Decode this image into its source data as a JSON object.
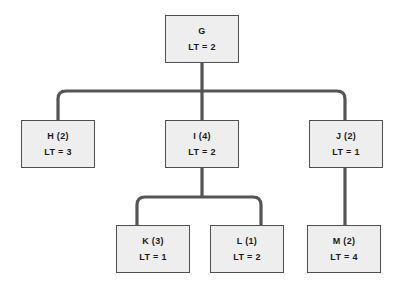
{
  "diagram": {
    "type": "tree",
    "background_color": "#ffffff",
    "node_fill_color": "#eeeeee",
    "node_border_color": "#4f4f4f",
    "connector_color": "#555555",
    "metric_prefix": "LT"
  },
  "nodes": [
    {
      "id": "G",
      "label": "G",
      "metric": "LT = 2",
      "lt": 2,
      "duration": null,
      "level": 0,
      "parent": null,
      "x": 165,
      "y": 15,
      "w": 74,
      "h": 48
    },
    {
      "id": "H",
      "label": "H (2)",
      "metric": "LT = 3",
      "lt": 3,
      "duration": 2,
      "level": 1,
      "parent": "G",
      "x": 21,
      "y": 120,
      "w": 74,
      "h": 48
    },
    {
      "id": "I",
      "label": "I (4)",
      "metric": "LT = 2",
      "lt": 2,
      "duration": 4,
      "level": 1,
      "parent": "G",
      "x": 165,
      "y": 120,
      "w": 74,
      "h": 48
    },
    {
      "id": "J",
      "label": "J (2)",
      "metric": "LT = 1",
      "lt": 1,
      "duration": 2,
      "level": 1,
      "parent": "G",
      "x": 309,
      "y": 120,
      "w": 74,
      "h": 48
    },
    {
      "id": "K",
      "label": "K (3)",
      "metric": "LT = 1",
      "lt": 1,
      "duration": 3,
      "level": 2,
      "parent": "I",
      "x": 116,
      "y": 225,
      "w": 74,
      "h": 48
    },
    {
      "id": "L",
      "label": "L (1)",
      "metric": "LT = 2",
      "lt": 2,
      "duration": 1,
      "level": 2,
      "parent": "I",
      "x": 210,
      "y": 225,
      "w": 74,
      "h": 48
    },
    {
      "id": "M",
      "label": "M (2)",
      "metric": "LT = 4",
      "lt": 4,
      "duration": 2,
      "level": 2,
      "parent": "J",
      "x": 307,
      "y": 225,
      "w": 74,
      "h": 48
    }
  ],
  "edges": [
    {
      "from": "G",
      "to": "H"
    },
    {
      "from": "G",
      "to": "I"
    },
    {
      "from": "G",
      "to": "J"
    },
    {
      "from": "I",
      "to": "K"
    },
    {
      "from": "I",
      "to": "L"
    },
    {
      "from": "J",
      "to": "M"
    }
  ]
}
